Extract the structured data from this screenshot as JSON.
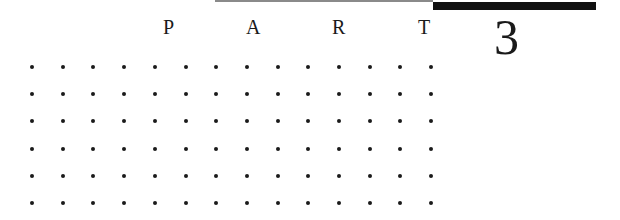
{
  "header": {
    "letters": [
      "P",
      "A",
      "R",
      "T"
    ],
    "letter_positions_x": [
      163,
      246,
      332,
      418
    ],
    "number": "3"
  },
  "decoration": {
    "thin_rule_color": "#8a8a8a",
    "thick_rule_color": "#111111"
  },
  "dot_grid": {
    "columns": 14,
    "rows": 6,
    "origin_x": 32,
    "origin_y": 67,
    "spacing_x": 30.7,
    "spacing_y": 27.2,
    "dot_color": "#1a1a1a"
  }
}
